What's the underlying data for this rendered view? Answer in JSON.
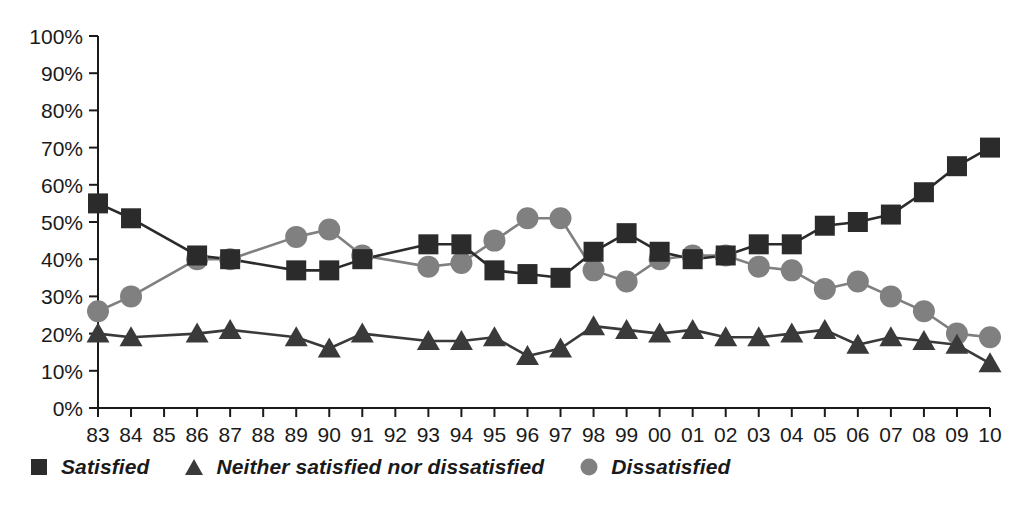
{
  "chart_data": {
    "type": "line",
    "title": "",
    "subtitle": "",
    "xlabel": "",
    "ylabel": "",
    "xlim_labels": [
      "83",
      "10"
    ],
    "ylim": [
      0,
      100
    ],
    "ytick_step": 10,
    "grid": false,
    "legend_position": "bottom-left",
    "ytick_labels": [
      "0%",
      "10%",
      "20%",
      "30%",
      "40%",
      "50%",
      "60%",
      "70%",
      "80%",
      "90%",
      "100%"
    ],
    "categories": [
      "83",
      "84",
      "85",
      "86",
      "87",
      "88",
      "89",
      "90",
      "91",
      "92",
      "93",
      "94",
      "95",
      "96",
      "97",
      "98",
      "99",
      "00",
      "01",
      "02",
      "03",
      "04",
      "05",
      "06",
      "07",
      "08",
      "09",
      "10"
    ],
    "series": [
      {
        "name": "Satisfied",
        "marker": "square",
        "color": "#2b2b2b",
        "values": [
          55,
          51,
          null,
          41,
          40,
          null,
          37,
          37,
          40,
          null,
          44,
          44,
          37,
          36,
          35,
          42,
          47,
          42,
          40,
          41,
          44,
          44,
          49,
          50,
          52,
          58,
          65,
          70
        ]
      },
      {
        "name": "Neither satisfied nor dissatisfied",
        "marker": "triangle",
        "color": "#3a3a3a",
        "values": [
          20,
          19,
          null,
          20,
          21,
          null,
          19,
          16,
          20,
          null,
          18,
          18,
          19,
          14,
          16,
          22,
          21,
          20,
          21,
          19,
          19,
          20,
          21,
          17,
          19,
          18,
          17,
          12
        ]
      },
      {
        "name": "Dissatisfied",
        "marker": "circle",
        "color": "#808080",
        "values": [
          26,
          30,
          null,
          40,
          40,
          null,
          46,
          48,
          41,
          null,
          38,
          39,
          45,
          51,
          51,
          37,
          34,
          40,
          41,
          41,
          38,
          37,
          32,
          34,
          30,
          26,
          20,
          19
        ]
      }
    ]
  },
  "legend": {
    "items": [
      {
        "label": "Satisfied",
        "marker": "square-marker-icon",
        "color": "#2b2b2b"
      },
      {
        "label": "Neither satisfied nor dissatisfied",
        "marker": "triangle-marker-icon",
        "color": "#3a3a3a"
      },
      {
        "label": "Dissatisfied",
        "marker": "circle-marker-icon",
        "color": "#808080"
      }
    ]
  },
  "axis": {
    "line_color": "#1a1a1a",
    "tick_label_color": "#1a1a1a"
  }
}
